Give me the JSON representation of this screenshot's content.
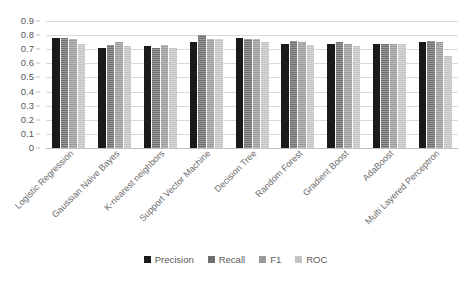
{
  "chart_data": {
    "type": "bar",
    "title": "",
    "subtitle": "",
    "xlabel": "",
    "ylabel": "",
    "ylim": [
      0,
      0.9
    ],
    "ytick_labels": [
      "0.9",
      "0.8",
      "0.7",
      "0.6",
      "0.5",
      "0.4",
      "0.3",
      "0.2",
      "0.1",
      "0"
    ],
    "ytick_values": [
      0.9,
      0.8,
      0.7,
      0.6,
      0.5,
      0.4,
      0.3,
      0.2,
      0.1,
      0
    ],
    "grid": true,
    "legend_position": "bottom",
    "categories": [
      "Logistic Regression",
      "Gaussian Naive Bayes",
      "K-nearest neighbors",
      "Support Vector Machine",
      "Decision Tree",
      "Random Forest",
      "Gradient Boost",
      "AdaBoost",
      "Multi Layered Perceptron"
    ],
    "series": [
      {
        "name": "Precision",
        "color": "#1a1a1a",
        "values": [
          0.78,
          0.71,
          0.72,
          0.75,
          0.78,
          0.74,
          0.74,
          0.74,
          0.75
        ]
      },
      {
        "name": "Recall",
        "color": "#6e6e6e",
        "values": [
          0.78,
          0.73,
          0.71,
          0.8,
          0.77,
          0.76,
          0.75,
          0.74,
          0.76
        ]
      },
      {
        "name": "F1",
        "color": "#9a9a9a",
        "values": [
          0.77,
          0.75,
          0.73,
          0.77,
          0.77,
          0.75,
          0.74,
          0.74,
          0.75
        ]
      },
      {
        "name": "ROC",
        "color": "#c4c4c4",
        "values": [
          0.74,
          0.72,
          0.71,
          0.77,
          0.75,
          0.73,
          0.72,
          0.74,
          0.65
        ]
      }
    ]
  }
}
